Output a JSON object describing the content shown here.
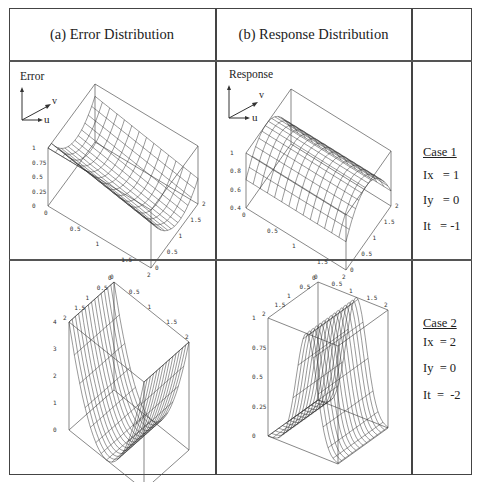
{
  "headers": {
    "col_a": "(a) Error Distribution",
    "col_b": "(b) Response Distribution",
    "col_c": ""
  },
  "plots": {
    "case1_error": {
      "label": "Error",
      "axis_u": "u",
      "axis_v": "v",
      "z_ticks": [
        "1",
        "0.75",
        "0.5",
        "0.25",
        "0"
      ],
      "x_ticks": [
        "0",
        "0.5",
        "1",
        "1.5",
        "2"
      ],
      "y_ticks": [
        "0",
        "0.5",
        "1",
        "1.5",
        "2"
      ]
    },
    "case1_response": {
      "label": "Response",
      "axis_u": "u",
      "axis_v": "v",
      "z_ticks": [
        "1",
        "0.8",
        "0.6",
        "0.4"
      ],
      "x_ticks": [
        "0",
        "0.5",
        "1",
        "1.5",
        "2"
      ],
      "y_ticks": [
        "0",
        "0.5",
        "1",
        "1.5",
        "2"
      ]
    },
    "case2_error": {
      "z_ticks": [
        "4",
        "3",
        "2",
        "1",
        "0"
      ],
      "x_ticks": [
        "0",
        "0.5",
        "1",
        "1.5",
        "2"
      ],
      "y_ticks": [
        "0",
        "0.5",
        "1",
        "1.5",
        "2"
      ]
    },
    "case2_response": {
      "z_ticks": [
        "1",
        "0.75",
        "0.5",
        "0.25",
        "0"
      ],
      "x_ticks": [
        "0",
        "0.5",
        "1",
        "1.5",
        "2"
      ],
      "y_ticks": [
        "0",
        "0.5",
        "1",
        "1.5",
        "2"
      ]
    }
  },
  "cases": [
    {
      "title": "Case  1",
      "ix": "Ix   = 1",
      "iy": "Iy   = 0",
      "it": "It   = -1"
    },
    {
      "title": "Case  2",
      "ix": "Ix  = 2",
      "iy": "Iy  = 0",
      "it": "It  =  -2"
    }
  ]
}
